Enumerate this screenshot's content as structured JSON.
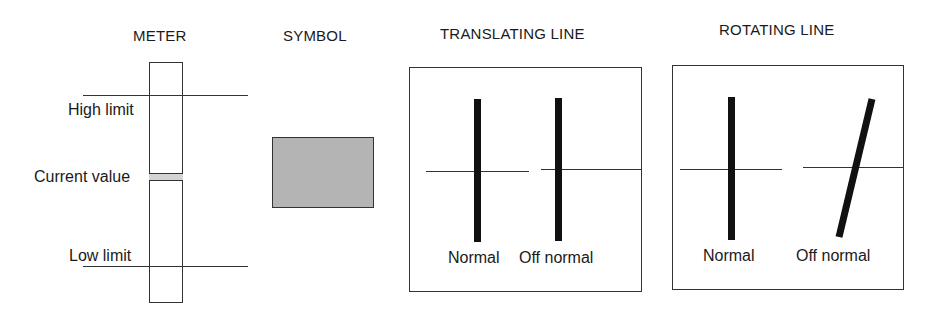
{
  "meter": {
    "title": "METER",
    "high_limit_label": "High limit",
    "current_value_label": "Current value",
    "low_limit_label": "Low limit"
  },
  "symbol": {
    "title": "SYMBOL",
    "fill_color": "#b4b4b4"
  },
  "translating_line": {
    "title": "TRANSLATING LINE",
    "normal_label": "Normal",
    "off_normal_label": "Off normal"
  },
  "rotating_line": {
    "title": "ROTATING LINE",
    "normal_label": "Normal",
    "off_normal_label": "Off normal"
  },
  "colors": {
    "line": "#333333",
    "bar": "#111111",
    "marker_fill": "#d4d4d4"
  }
}
